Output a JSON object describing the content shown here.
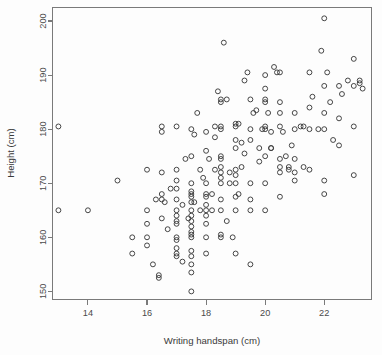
{
  "chart_data": {
    "type": "scatter",
    "title": "",
    "xlabel": "Writing handspan (cm)",
    "ylabel": "Height (cm)",
    "xlim": [
      12.8,
      23.6
    ],
    "ylim": [
      148.5,
      202.5
    ],
    "xticks": [
      14,
      16,
      18,
      20,
      22
    ],
    "yticks": [
      150,
      160,
      170,
      180,
      190,
      200
    ],
    "xtick_labels": [
      "14",
      "16",
      "18",
      "20",
      "22"
    ],
    "ytick_labels": [
      "150",
      "160",
      "170",
      "180",
      "190",
      "200"
    ],
    "grid": false,
    "legend": null,
    "marker": "open-circle",
    "marker_color": "#3c3c3c",
    "n_points": 198,
    "x": [
      13.0,
      13.0,
      14.0,
      15.0,
      15.5,
      15.5,
      16.0,
      16.0,
      16.0,
      16.0,
      16.0,
      16.2,
      16.3,
      16.4,
      16.4,
      16.5,
      16.5,
      16.5,
      16.5,
      16.5,
      16.5,
      16.6,
      16.7,
      17.0,
      17.0,
      17.0,
      17.0,
      17.0,
      17.0,
      17.0,
      17.0,
      17.0,
      17.0,
      17.0,
      17.0,
      17.0,
      17.0,
      17.2,
      17.2,
      17.3,
      17.4,
      17.5,
      17.5,
      17.5,
      17.5,
      17.5,
      17.5,
      17.5,
      17.5,
      17.5,
      17.5,
      17.5,
      17.5,
      17.5,
      17.5,
      17.5,
      17.5,
      17.5,
      17.5,
      17.5,
      17.6,
      17.7,
      17.8,
      17.8,
      18.0,
      18.0,
      18.0,
      18.0,
      18.0,
      18.0,
      18.0,
      18.0,
      18.0,
      18.0,
      18.0,
      18.1,
      18.2,
      18.2,
      18.3,
      18.3,
      18.4,
      18.5,
      18.5,
      18.5,
      18.5,
      18.5,
      18.5,
      18.5,
      18.5,
      18.5,
      18.5,
      18.5,
      18.5,
      18.5,
      18.5,
      18.6,
      18.7,
      18.7,
      18.8,
      18.8,
      18.9,
      19.0,
      19.0,
      19.0,
      19.0,
      19.0,
      19.0,
      19.0,
      19.0,
      19.0,
      19.0,
      19.1,
      19.2,
      19.2,
      19.3,
      19.3,
      19.4,
      19.5,
      19.5,
      19.5,
      19.5,
      19.5,
      19.5,
      19.5,
      19.6,
      19.7,
      19.8,
      19.9,
      20.0,
      20.0,
      20.0,
      20.0,
      20.0,
      20.0,
      20.0,
      20.0,
      20.0,
      20.1,
      20.2,
      20.2,
      20.3,
      20.4,
      20.5,
      20.5,
      20.5,
      20.5,
      20.5,
      20.5,
      20.5,
      20.5,
      20.6,
      20.7,
      20.8,
      20.8,
      20.9,
      21.0,
      21.0,
      21.0,
      21.0,
      21.0,
      21.2,
      21.3,
      21.5,
      21.5,
      21.5,
      21.5,
      21.6,
      21.8,
      21.9,
      22.0,
      22.0,
      22.0,
      22.0,
      22.0,
      22.0,
      22.1,
      22.2,
      22.3,
      22.5,
      22.5,
      22.5,
      22.6,
      22.8,
      23.0,
      23.0,
      23.0,
      23.0,
      23.2,
      23.2,
      23.3,
      19.8,
      18.3,
      17.9,
      20.2,
      21.3,
      16.8,
      17.6,
      19.1
    ],
    "y": [
      180.5,
      165.0,
      165.0,
      170.5,
      157.0,
      160.0,
      160.0,
      165.0,
      162.5,
      172.5,
      158.5,
      155.0,
      167.0,
      152.5,
      153.0,
      168.0,
      167.0,
      163.5,
      172.0,
      180.5,
      179.5,
      166.5,
      161.5,
      170.5,
      164.0,
      162.5,
      163.0,
      157.0,
      156.5,
      158.0,
      159.5,
      160.0,
      165.0,
      167.0,
      169.0,
      172.5,
      180.5,
      166.0,
      155.5,
      174.5,
      163.5,
      150.0,
      153.5,
      155.0,
      156.5,
      157.5,
      160.0,
      160.5,
      161.0,
      162.0,
      163.0,
      164.0,
      165.0,
      166.5,
      167.5,
      168.0,
      168.5,
      170.0,
      175.0,
      180.0,
      179.0,
      183.0,
      165.0,
      172.5,
      157.0,
      160.0,
      162.5,
      164.0,
      165.0,
      166.0,
      167.5,
      168.0,
      170.0,
      176.0,
      179.5,
      174.5,
      165.0,
      168.0,
      172.5,
      180.5,
      187.0,
      160.0,
      160.5,
      165.0,
      167.0,
      170.0,
      171.0,
      172.0,
      173.0,
      174.5,
      175.0,
      180.0,
      180.5,
      185.0,
      185.5,
      196.0,
      163.0,
      185.5,
      170.0,
      172.0,
      160.0,
      157.0,
      165.0,
      167.5,
      170.0,
      171.5,
      172.5,
      176.5,
      178.0,
      180.5,
      181.0,
      168.0,
      173.0,
      177.5,
      175.5,
      189.0,
      190.5,
      155.0,
      165.0,
      167.0,
      170.0,
      178.0,
      180.0,
      185.5,
      183.0,
      183.5,
      176.5,
      180.0,
      165.0,
      170.0,
      175.0,
      180.0,
      180.5,
      185.0,
      185.5,
      187.5,
      190.0,
      183.0,
      176.5,
      179.5,
      191.5,
      190.5,
      167.5,
      172.0,
      173.0,
      174.5,
      180.5,
      183.0,
      185.0,
      190.5,
      179.5,
      175.0,
      172.5,
      173.0,
      177.0,
      170.5,
      172.0,
      174.5,
      180.0,
      183.0,
      180.5,
      173.0,
      172.5,
      180.0,
      184.0,
      190.5,
      186.0,
      180.0,
      194.5,
      168.0,
      170.5,
      180.0,
      183.0,
      188.0,
      200.5,
      190.5,
      185.0,
      178.0,
      182.0,
      188.0,
      177.0,
      186.5,
      189.0,
      171.5,
      180.5,
      188.0,
      193.0,
      188.5,
      189.0,
      187.5,
      174.0,
      178.5,
      171.0,
      176.5,
      180.5,
      169.0,
      166.5,
      181.0
    ]
  },
  "axes": {
    "x_title": "Writing handspan (cm)",
    "y_title": "Height (cm)"
  }
}
